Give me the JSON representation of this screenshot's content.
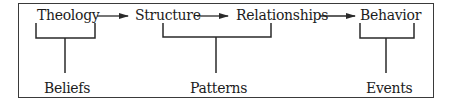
{
  "diagram": {
    "top_row": [
      "Theology",
      "Structure",
      "Relationships",
      "Behavior"
    ],
    "bottom_row": [
      "Beliefs",
      "Patterns",
      "Events"
    ],
    "flow": [
      {
        "from": "Theology",
        "to": "Structure"
      },
      {
        "from": "Structure",
        "to": "Relationships"
      },
      {
        "from": "Relationships",
        "to": "Behavior"
      }
    ],
    "groupings": [
      {
        "label": "Beliefs",
        "groups": [
          "Theology"
        ]
      },
      {
        "label": "Patterns",
        "groups": [
          "Structure",
          "Relationships"
        ]
      },
      {
        "label": "Events",
        "groups": [
          "Behavior"
        ]
      }
    ],
    "colors": {
      "line": "#2a2a2a",
      "text": "#1c1c1c",
      "background": "#ffffff"
    }
  }
}
